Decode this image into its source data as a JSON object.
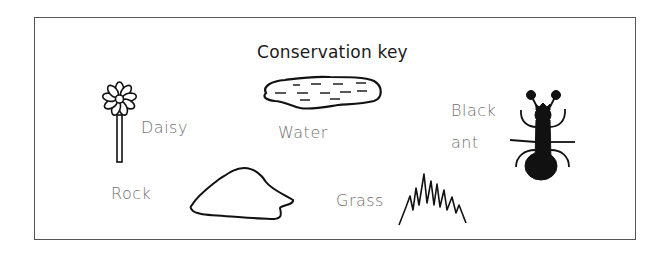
{
  "title": "Conservation key",
  "items": [
    {
      "id": "daisy",
      "label": "Daisy",
      "icon": "daisy-icon"
    },
    {
      "id": "water",
      "label": "Water",
      "icon": "water-icon"
    },
    {
      "id": "black-ant",
      "label_line1": "Black",
      "label_line2": "ant",
      "icon": "ant-icon"
    },
    {
      "id": "rock",
      "label": "Rock",
      "icon": "rock-icon"
    },
    {
      "id": "grass",
      "label": "Grass",
      "icon": "grass-icon"
    }
  ],
  "colors": {
    "stroke": "#111111",
    "label": "#707070",
    "border": "#555555"
  }
}
